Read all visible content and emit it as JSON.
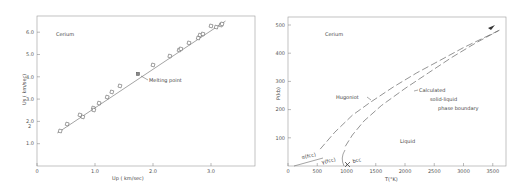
{
  "chart_data": [
    {
      "type": "scatter",
      "title": "",
      "annotation_text": "Cerium",
      "xlabel": "U_p ( km/sec)",
      "ylabel": "U_s ( km/sec)",
      "xlim": [
        0,
        3.8
      ],
      "ylim": [
        0,
        6.6
      ],
      "xticks": [
        "0",
        "1.0",
        "2.0",
        "3.0"
      ],
      "yticks": [
        "1.0",
        "2.0",
        "3.0",
        "4.0",
        "5.0",
        "6.0"
      ],
      "grid": false,
      "legend": null,
      "series": [
        {
          "name": "Hugoniot data",
          "marker": "open-square",
          "x": [
            0.4,
            0.52,
            0.74,
            0.79,
            0.97,
            0.98,
            1.07,
            1.21,
            1.29,
            1.43,
            1.74,
            2.0,
            2.29,
            2.45,
            2.48,
            2.62,
            2.78,
            2.81,
            2.86,
            3.0,
            3.09,
            3.17,
            3.19
          ],
          "y": [
            1.57,
            1.88,
            2.29,
            2.2,
            2.6,
            2.51,
            2.82,
            3.09,
            3.32,
            3.59,
            4.13,
            4.53,
            4.93,
            5.2,
            5.25,
            5.52,
            5.74,
            5.87,
            5.92,
            6.28,
            6.23,
            6.32,
            6.37
          ]
        },
        {
          "name": "Linear fit",
          "type": "line",
          "x": [
            0.35,
            3.25
          ],
          "y": [
            1.48,
            6.5
          ]
        }
      ],
      "annotations": [
        {
          "text": "Melting point",
          "x": 1.74,
          "y": 4.13
        }
      ]
    },
    {
      "type": "line",
      "title": "",
      "annotation_text": "Cerium",
      "xlabel": "T(°K)",
      "ylabel": "P(kb)",
      "xlim": [
        0,
        3800
      ],
      "ylim": [
        0,
        530
      ],
      "xticks": [
        "0",
        "500",
        "1000",
        "1500",
        "2000",
        "2500",
        "3000",
        "3500"
      ],
      "yticks": [
        "100",
        "200",
        "300",
        "400",
        "500"
      ],
      "grid": false,
      "legend": null,
      "series": [
        {
          "name": "Hugoniot",
          "style": "dashed",
          "x": [
            550,
            800,
            1100,
            1400,
            1800,
            2200,
            2600,
            3000,
            3400,
            3650
          ],
          "y": [
            60,
            120,
            180,
            225,
            280,
            330,
            375,
            420,
            460,
            485
          ]
        },
        {
          "name": "Calculated solid-liquid phase boundary",
          "style": "dashed",
          "x": [
            1000,
            960,
            980,
            1100,
            1300,
            1600,
            2000,
            2400,
            2800,
            3200,
            3600
          ],
          "y": [
            0,
            30,
            70,
            110,
            160,
            215,
            275,
            330,
            385,
            435,
            480
          ]
        },
        {
          "name": "alpha(fcc)-gamma(fcc) boundary",
          "style": "solid",
          "x": [
            100,
            350,
            600
          ],
          "y": [
            0,
            12,
            25
          ]
        }
      ],
      "annotations": [
        {
          "text": "Hugoniot",
          "x": 1000,
          "y": 245
        },
        {
          "text": "Calculated",
          "x": 2300,
          "y": 270
        },
        {
          "text": "solid-liquid",
          "x": 2400,
          "y": 240
        },
        {
          "text": "phase boundary",
          "x": 2600,
          "y": 210
        },
        {
          "text": "Liquid",
          "x": 1950,
          "y": 90
        },
        {
          "text": "α(fcc)",
          "x": 300,
          "y": 35
        },
        {
          "text": "γ(fcc)",
          "x": 650,
          "y": 20
        },
        {
          "text": "bcc",
          "x": 1150,
          "y": 15
        }
      ]
    }
  ],
  "left": {
    "material": "Cerium",
    "xlabel": "Up ( km/sec)",
    "ylabel": "Us ( km/sec)",
    "xticks": [
      "0",
      "1.0",
      "2.0",
      "3.0"
    ],
    "yticks": [
      "1.0",
      "2.0",
      "3.0",
      "4.0",
      "5.0",
      "6.0"
    ],
    "annotation": "Melting point",
    "stray_mark": "2"
  },
  "right": {
    "material": "Cerium",
    "xlabel": "T(°K)",
    "ylabel": "P(kb)",
    "xticks": [
      "0",
      "500",
      "1000",
      "1500",
      "2000",
      "2500",
      "3000",
      "3500"
    ],
    "yticks": [
      "100",
      "200",
      "300",
      "400",
      "500"
    ],
    "hugoniot_label": "Hugoniot",
    "boundary_label_1": "Calculated",
    "boundary_label_2": "solid-liquid",
    "boundary_label_3": "phase boundary",
    "liquid_label": "Liquid",
    "alpha_label": "α(fcc)",
    "gamma_label": "γ(fcc)",
    "bcc_label": "bcc"
  }
}
